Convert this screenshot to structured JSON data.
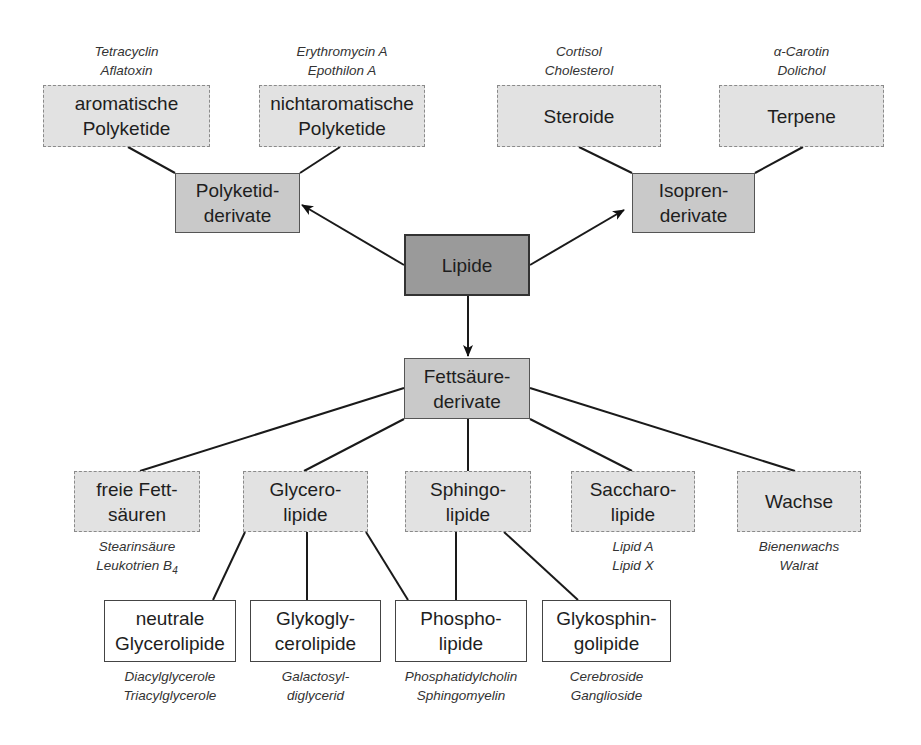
{
  "diagram": {
    "root": {
      "line1": "Lipide"
    },
    "polyketid": {
      "line1": "Polyketid-",
      "line2": "derivate"
    },
    "isopren": {
      "line1": "Isopren-",
      "line2": "derivate"
    },
    "fettsaeure": {
      "line1": "Fettsäure-",
      "line2": "derivate"
    },
    "aromatisch": {
      "line1": "aromatische",
      "line2": "Polyketide",
      "ex1": "Tetracyclin",
      "ex2": "Aflatoxin"
    },
    "nichtaromatisch": {
      "line1": "nichtaromatische",
      "line2": "Polyketide",
      "ex1": "Erythromycin A",
      "ex2": "Epothilon A"
    },
    "steroide": {
      "line1": "Steroide",
      "ex1": "Cortisol",
      "ex2": "Cholesterol"
    },
    "terpene": {
      "line1": "Terpene",
      "ex1": "α-Carotin",
      "ex2": "Dolichol"
    },
    "freie": {
      "line1": "freie Fett-",
      "line2": "säuren",
      "ex1": "Stearinsäure",
      "ex2": "Leukotrien B",
      "ex2_sub": "4"
    },
    "glycero": {
      "line1": "Glycero-",
      "line2": "lipide"
    },
    "sphingo": {
      "line1": "Sphingo-",
      "line2": "lipide"
    },
    "saccharo": {
      "line1": "Saccharo-",
      "line2": "lipide",
      "ex1": "Lipid A",
      "ex2": "Lipid X"
    },
    "wachse": {
      "line1": "Wachse",
      "ex1": "Bienenwachs",
      "ex2": "Walrat"
    },
    "neutrale": {
      "line1": "neutrale",
      "line2": "Glycerolipide",
      "ex1": "Diacylglycerole",
      "ex2": "Triacylglycerole"
    },
    "glykogly": {
      "line1": "Glykogly-",
      "line2": "cerolipide",
      "ex1": "Galactosyl-",
      "ex2": "diglycerid"
    },
    "phospho": {
      "line1": "Phospho-",
      "line2": "lipide",
      "ex1": "Phosphatidylcholin",
      "ex2": "Sphingomyelin"
    },
    "glykosphin": {
      "line1": "Glykosphin-",
      "line2": "golipide",
      "ex1": "Cerebroside",
      "ex2": "Ganglioside"
    }
  },
  "colors": {
    "root": "#9a9a9a",
    "mid": "#c9c9c9",
    "leaf": "#e2e2e2",
    "plain": "#ffffff"
  }
}
